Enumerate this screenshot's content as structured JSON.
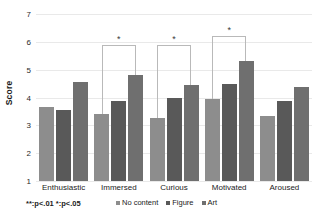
{
  "chart_data": {
    "type": "bar",
    "title": "",
    "xlabel": "",
    "ylabel": "Score",
    "ylim": [
      1,
      7
    ],
    "yticks": [
      1,
      2,
      3,
      4,
      5,
      6,
      7
    ],
    "grid": true,
    "legend_position": "bottom",
    "categories": [
      "Enthusiastic",
      "Immersed",
      "Curious",
      "Motivated",
      "Aroused"
    ],
    "series": [
      {
        "name": "No content",
        "color": "#8d8d8d",
        "values": [
          3.65,
          3.42,
          3.27,
          3.93,
          3.35
        ]
      },
      {
        "name": "Figure",
        "color": "#595959",
        "values": [
          3.55,
          3.88,
          3.98,
          4.48,
          3.88
        ]
      },
      {
        "name": "Art",
        "color": "#6f6f6f",
        "values": [
          4.55,
          4.82,
          4.45,
          5.32,
          4.38
        ]
      }
    ],
    "annotations": [
      {
        "category": "Immersed",
        "from_series": "No content",
        "to_series": "Art",
        "label": "*",
        "top_value": 5.9
      },
      {
        "category": "Curious",
        "from_series": "No content",
        "to_series": "Art",
        "label": "*",
        "top_value": 5.9
      },
      {
        "category": "Motivated",
        "from_series": "No content",
        "to_series": "Art",
        "label": "*",
        "top_value": 6.2
      }
    ],
    "footnote": "**:p<.01  *:p<.05"
  }
}
